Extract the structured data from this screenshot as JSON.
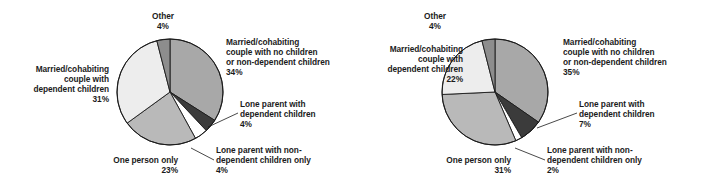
{
  "figure": {
    "background": "#ffffff",
    "panel_count": 2
  },
  "chart_data": [
    {
      "type": "pie",
      "id": "households-pie-left",
      "title": "",
      "subtitle": "",
      "xlabel": "",
      "ylabel": "",
      "legend_position": "none",
      "grid": false,
      "start_angle_deg": 0,
      "direction": "clockwise",
      "units": "percent",
      "categories": [
        "Married/cohabiting couple with no children or non-dependent children",
        "Lone parent with dependent children",
        "Lone parent with non-dependent children only",
        "One person only",
        "Married/cohabiting couple with dependent children",
        "Other"
      ],
      "values": [
        34,
        4,
        4,
        23,
        31,
        4
      ],
      "value_labels": [
        "34%",
        "4%",
        "4%",
        "23%",
        "31%",
        "4%"
      ],
      "colors": [
        "#a8a8a8",
        "#3b3b3b",
        "#ffffff",
        "#b9b9b9",
        "#ededed",
        "#8d8d8d"
      ],
      "slice_stroke": "#1a1a1a",
      "labels": [
        {
          "name": "married-no-children",
          "text": "Married/cohabiting\ncouple with no children\nor non-dependent children",
          "pct": "34%",
          "align": "left",
          "x": 226,
          "y": 37,
          "width": 132,
          "leader": false
        },
        {
          "name": "lone-parent-dependent",
          "text": "Lone parent with\ndependent children",
          "pct": "4%",
          "align": "left",
          "x": 240,
          "y": 99,
          "width": 114,
          "leader": true
        },
        {
          "name": "lone-parent-non-dependent",
          "text": "Lone parent with non-\ndependent children only",
          "pct": "4%",
          "align": "left",
          "x": 216,
          "y": 145,
          "width": 130,
          "leader": true
        },
        {
          "name": "one-person-only",
          "text": "One person only",
          "pct": "23%",
          "align": "right",
          "x": 60,
          "y": 155,
          "width": 118,
          "leader": false
        },
        {
          "name": "married-dependent-children",
          "text": "Married/cohabiting\ncouple with\ndependent children",
          "pct": "31%",
          "align": "right",
          "x": 3,
          "y": 64,
          "width": 106,
          "leader": false
        },
        {
          "name": "other",
          "text": "Other",
          "pct": "4%",
          "align": "center",
          "x": 133,
          "y": 11,
          "width": 60,
          "leader": false
        }
      ]
    },
    {
      "type": "pie",
      "id": "households-pie-right",
      "title": "",
      "subtitle": "",
      "xlabel": "",
      "ylabel": "",
      "legend_position": "none",
      "grid": false,
      "start_angle_deg": 0,
      "direction": "clockwise",
      "units": "percent",
      "categories": [
        "Married/cohabiting couple with no children or non-dependent children",
        "Lone parent with dependent children",
        "Lone parent with non-dependent children only",
        "One person only",
        "Married/cohabiting couple with dependent children",
        "Other"
      ],
      "values": [
        35,
        7,
        2,
        31,
        22,
        4
      ],
      "value_labels": [
        "35%",
        "7%",
        "2%",
        "31%",
        "22%",
        "4%"
      ],
      "colors": [
        "#a8a8a8",
        "#3b3b3b",
        "#ffffff",
        "#b9b9b9",
        "#ededed",
        "#8d8d8d"
      ],
      "slice_stroke": "#1a1a1a",
      "labels": [
        {
          "name": "married-no-children",
          "text": "Married/cohabiting\ncouple with no children\nor non-dependent children",
          "pct": "35%",
          "align": "left",
          "x": 208,
          "y": 37,
          "width": 140,
          "leader": false
        },
        {
          "name": "lone-parent-dependent",
          "text": "Lone parent with\ndependent children",
          "pct": "7%",
          "align": "left",
          "x": 224,
          "y": 99,
          "width": 114,
          "leader": true
        },
        {
          "name": "lone-parent-non-dependent",
          "text": "Lone parent with non-\ndependent children only",
          "pct": "2%",
          "align": "left",
          "x": 192,
          "y": 145,
          "width": 130,
          "leader": true
        },
        {
          "name": "one-person-only",
          "text": "One person only",
          "pct": "31%",
          "align": "right",
          "x": 38,
          "y": 155,
          "width": 118,
          "leader": false
        },
        {
          "name": "married-dependent-children",
          "text": "Married/cohabiting\ncouple with\ndependent children",
          "pct": "22%",
          "align": "right",
          "x": 0,
          "y": 44,
          "width": 108,
          "leader": false
        },
        {
          "name": "other",
          "text": "Other",
          "pct": "4%",
          "align": "center",
          "x": 50,
          "y": 11,
          "width": 60,
          "leader": false
        }
      ]
    }
  ]
}
